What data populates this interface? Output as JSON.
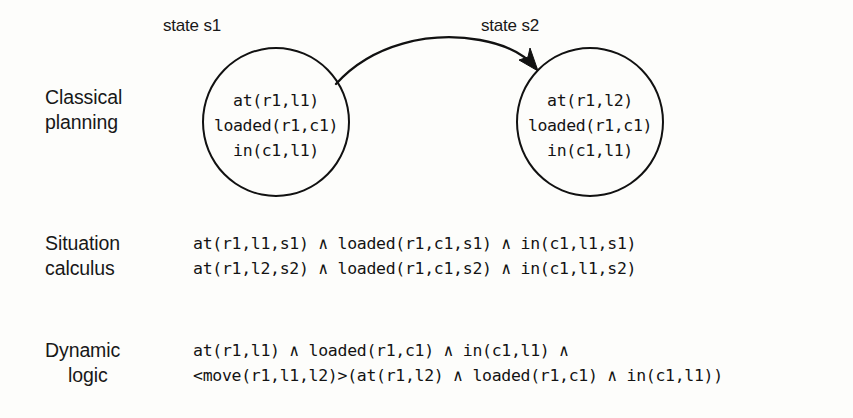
{
  "figure": {
    "background_color": "#fdfdfb",
    "ink_color": "#111111",
    "states": [
      {
        "caption": "state s1",
        "predicates": [
          "at(r1,l1)",
          "loaded(r1,c1)",
          "in(c1,l1)"
        ]
      },
      {
        "caption": "state s2",
        "predicates": [
          "at(r1,l2)",
          "loaded(r1,c1)",
          "in(c1,l1)"
        ]
      }
    ],
    "transition": {
      "icon": "curved-arrow-icon",
      "direction": "left-to-right"
    },
    "rows": [
      {
        "label_line1": "Classical",
        "label_line2": "planning"
      },
      {
        "label_line1": "Situation",
        "label_line2": "calculus",
        "formulas": [
          "at(r1,l1,s1) ∧ loaded(r1,c1,s1) ∧ in(c1,l1,s1)",
          "at(r1,l2,s2) ∧ loaded(r1,c1,s2) ∧ in(c1,l1,s2)"
        ]
      },
      {
        "label_line1": "Dynamic",
        "label_line2": "logic",
        "formulas": [
          "at(r1,l1) ∧ loaded(r1,c1) ∧ in(c1,l1) ∧",
          "<move(r1,l1,l2)>(at(r1,l2) ∧ loaded(r1,c1) ∧ in(c1,l1))"
        ]
      }
    ]
  }
}
